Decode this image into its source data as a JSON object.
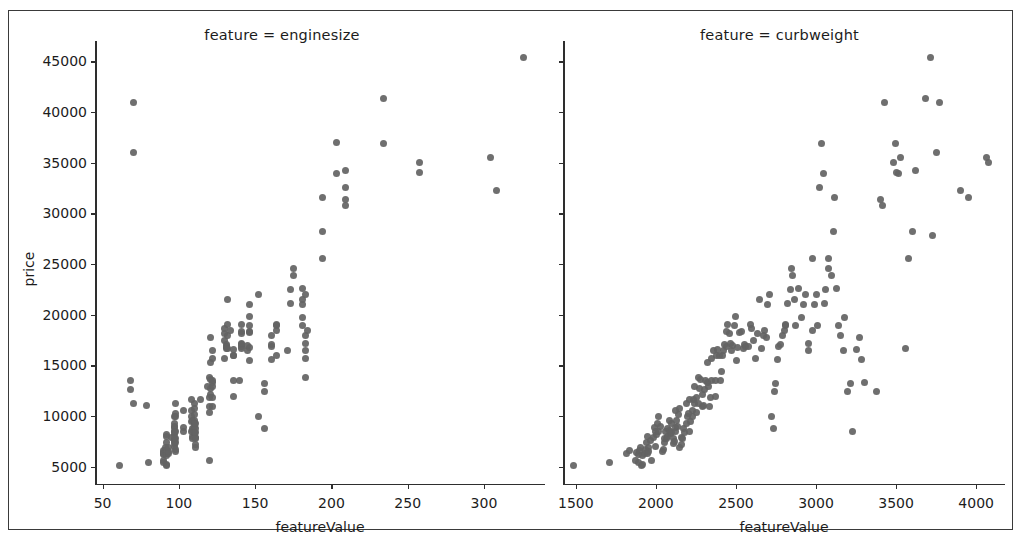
{
  "figure": {
    "ylabel": "price",
    "dot_color": "#636363",
    "axis_color": "#2e2e2e",
    "frame_color": "#3a3a3a"
  },
  "panels": [
    {
      "title": "feature = enginesize",
      "xlabel": "featureValue",
      "xticks": [
        50,
        100,
        150,
        200,
        250,
        300
      ],
      "xlim": [
        45,
        340
      ],
      "ylim": [
        3200,
        47000
      ],
      "yticks": [
        5000,
        10000,
        15000,
        20000,
        25000,
        30000,
        35000,
        40000,
        45000
      ]
    },
    {
      "title": "feature = curbweight",
      "xlabel": "featureValue",
      "xticks": [
        1500,
        2000,
        2500,
        3000,
        3500,
        4000
      ],
      "xlim": [
        1420,
        4180
      ],
      "ylim": [
        3200,
        47000
      ],
      "yticks": [
        5000,
        10000,
        15000,
        20000,
        25000,
        30000,
        35000,
        40000,
        45000
      ]
    }
  ],
  "chart_data": [
    {
      "type": "scatter",
      "title": "feature = enginesize",
      "xlabel": "featureValue",
      "ylabel": "price",
      "xlim": [
        45,
        340
      ],
      "ylim": [
        3200,
        47000
      ],
      "xticks": [
        50,
        100,
        150,
        200,
        250,
        300
      ],
      "yticks": [
        5000,
        10000,
        15000,
        20000,
        25000,
        30000,
        35000,
        40000,
        45000
      ],
      "grid": false,
      "legend": null,
      "marker_color": "#636363",
      "x": [
        61,
        80,
        90,
        90,
        90,
        90,
        90,
        90,
        91,
        91,
        92,
        92,
        92,
        92,
        92,
        92,
        92,
        92,
        93,
        93,
        93,
        95,
        97,
        97,
        97,
        97,
        97,
        97,
        97,
        97,
        97,
        97,
        97,
        97,
        98,
        98,
        98,
        98,
        98,
        98,
        98,
        98,
        103,
        103,
        103,
        108,
        108,
        108,
        108,
        108,
        109,
        109,
        109,
        109,
        109,
        110,
        110,
        110,
        110,
        110,
        110,
        110,
        110,
        111,
        111,
        111,
        111,
        111,
        111,
        111,
        114,
        119,
        120,
        120,
        120,
        121,
        121,
        121,
        121,
        121,
        122,
        122,
        122,
        122,
        122,
        122,
        122,
        130,
        130,
        130,
        130,
        131,
        131,
        131,
        131,
        132,
        132,
        132,
        132,
        134,
        136,
        136,
        136,
        136,
        136,
        140,
        141,
        141,
        141,
        141,
        141,
        141,
        141,
        145,
        145,
        146,
        146,
        146,
        146,
        146,
        146,
        146,
        152,
        152,
        156,
        156,
        156,
        161,
        161,
        161,
        161,
        164,
        164,
        164,
        164,
        171,
        173,
        173,
        175,
        175,
        181,
        181,
        181,
        181,
        181,
        183,
        183,
        183,
        183,
        183,
        183,
        184,
        194,
        194,
        194,
        203,
        203,
        209,
        209,
        209,
        209,
        234,
        234,
        258,
        258,
        304,
        308,
        326,
        70,
        70,
        70,
        68,
        68,
        79,
        120,
        120
      ],
      "y": [
        5151,
        5399,
        6295,
        6575,
        6377,
        6229,
        5572,
        5389,
        6649,
        6855,
        5118,
        5195,
        6295,
        6095,
        6695,
        7395,
        7995,
        8195,
        6338,
        6488,
        6918,
        7898,
        7609,
        8921,
        8449,
        6989,
        8189,
        9279,
        9959,
        8499,
        8949,
        7299,
        7799,
        7499,
        6479,
        6695,
        7395,
        7795,
        8495,
        10245,
        11245,
        9995,
        8845,
        8495,
        10595,
        8495,
        9495,
        9995,
        10595,
        11595,
        7775,
        7975,
        8778,
        8558,
        9538,
        8238,
        8358,
        9298,
        9538,
        8948,
        10198,
        10698,
        11248,
        6938,
        7198,
        7898,
        7788,
        8778,
        8358,
        9258,
        11595,
        12945,
        10345,
        11845,
        13845,
        12764,
        13645,
        12170,
        15250,
        17710,
        13295,
        12945,
        10945,
        11845,
        13495,
        15645,
        16515,
        18150,
        18620,
        17450,
        15645,
        16695,
        17075,
        16900,
        16845,
        19045,
        21485,
        16630,
        17950,
        18399,
        11900,
        13499,
        15998,
        16558,
        15998,
        13499,
        16695,
        17075,
        16900,
        18345,
        19045,
        18150,
        17199,
        16430,
        17000,
        18920,
        19845,
        15510,
        16770,
        18280,
        18344,
        20970,
        22018,
        9988,
        8778,
        12440,
        13200,
        15580,
        16900,
        17075,
        17950,
        18399,
        18920,
        19045,
        15985,
        16515,
        21105,
        22470,
        24565,
        23875,
        21485,
        18950,
        22625,
        19699,
        20970,
        22018,
        13845,
        15645,
        16515,
        17199,
        17950,
        18399,
        25552,
        28176,
        31600,
        37028,
        33900,
        32528,
        34184,
        31400,
        30760,
        36880,
        41315,
        34028,
        35056,
        35550,
        32250,
        45400,
        40960,
        35999,
        11199,
        13499,
        12629,
        11048,
        10898,
        5572,
        9095,
        9980
      ],
      "notes": "Price (USD) vs. engine size; strong positive correlation, ~200 points"
    },
    {
      "type": "scatter",
      "title": "feature = curbweight",
      "xlabel": "featureValue",
      "ylabel": "price",
      "xlim": [
        1420,
        4180
      ],
      "ylim": [
        3200,
        47000
      ],
      "xticks": [
        1500,
        2000,
        2500,
        3000,
        3500,
        4000
      ],
      "yticks": [
        5000,
        10000,
        15000,
        20000,
        25000,
        30000,
        35000,
        40000,
        45000
      ],
      "grid": false,
      "legend": null,
      "marker_color": "#636363",
      "x": [
        1488,
        1713,
        1819,
        1837,
        1874,
        1876,
        1889,
        1890,
        1900,
        1905,
        1909,
        1918,
        1918,
        1927,
        1938,
        1944,
        1945,
        1950,
        1951,
        1956,
        1967,
        1971,
        1985,
        1989,
        1995,
        1996,
        2004,
        2010,
        2017,
        2019,
        2028,
        2040,
        2050,
        2052,
        2055,
        2062,
        2065,
        2070,
        2075,
        2082,
        2085,
        2090,
        2095,
        2100,
        2108,
        2110,
        2116,
        2120,
        2122,
        2125,
        2128,
        2135,
        2140,
        2145,
        2150,
        2157,
        2160,
        2169,
        2172,
        2180,
        2190,
        2191,
        2200,
        2204,
        2208,
        2212,
        2219,
        2227,
        2230,
        2233,
        2240,
        2244,
        2251,
        2254,
        2264,
        2265,
        2275,
        2280,
        2289,
        2293,
        2300,
        2304,
        2310,
        2320,
        2324,
        2328,
        2335,
        2340,
        2349,
        2350,
        2360,
        2370,
        2372,
        2380,
        2385,
        2395,
        2403,
        2410,
        2414,
        2425,
        2430,
        2440,
        2443,
        2450,
        2458,
        2465,
        2472,
        2480,
        2489,
        2500,
        2505,
        2510,
        2520,
        2535,
        2548,
        2551,
        2560,
        2579,
        2590,
        2600,
        2612,
        2624,
        2635,
        2650,
        2661,
        2670,
        2679,
        2690,
        2700,
        2710,
        2720,
        2734,
        2740,
        2750,
        2760,
        2765,
        2778,
        2790,
        2800,
        2808,
        2811,
        2820,
        2840,
        2844,
        2850,
        2865,
        2870,
        2890,
        2910,
        2920,
        2935,
        2952,
        2954,
        2976,
        2980,
        2990,
        3000,
        3012,
        3020,
        3034,
        3045,
        3050,
        3062,
        3075,
        3080,
        3095,
        3110,
        3115,
        3130,
        3139,
        3151,
        3170,
        3180,
        3197,
        3217,
        3230,
        3250,
        3270,
        3285,
        3300,
        3380,
        3400,
        3415,
        3430,
        3485,
        3495,
        3505,
        3515,
        3530,
        3560,
        3580,
        3600,
        3620,
        3685,
        3715,
        3730,
        3750,
        3770,
        3900,
        3950,
        4066,
        4080
      ],
      "y": [
        5151,
        5399,
        6295,
        6575,
        5572,
        6377,
        6229,
        5389,
        6649,
        6855,
        5118,
        6095,
        5195,
        6295,
        6695,
        7395,
        7995,
        6338,
        6488,
        6918,
        7609,
        5572,
        7898,
        8921,
        6989,
        8449,
        8189,
        9279,
        8499,
        9959,
        8948,
        6479,
        6695,
        7395,
        7795,
        8495,
        7775,
        7975,
        8778,
        8558,
        9538,
        8238,
        8358,
        9298,
        7299,
        7799,
        7499,
        8845,
        8495,
        10595,
        9538,
        8948,
        10198,
        10698,
        6938,
        7198,
        7898,
        7788,
        8778,
        8358,
        9258,
        11245,
        9995,
        10245,
        11595,
        8495,
        9495,
        9995,
        10595,
        11595,
        11248,
        12945,
        10345,
        11845,
        13845,
        11199,
        12764,
        13645,
        12170,
        10898,
        11048,
        12629,
        13499,
        15250,
        13295,
        12945,
        10945,
        11845,
        13495,
        15645,
        16515,
        11900,
        13499,
        15998,
        16558,
        15998,
        13499,
        14399,
        15985,
        16515,
        17075,
        16900,
        18345,
        19045,
        18150,
        17199,
        16430,
        17000,
        18920,
        19845,
        15510,
        16770,
        18280,
        18344,
        16695,
        17075,
        16900,
        16845,
        19045,
        18620,
        17450,
        15645,
        18150,
        21485,
        16630,
        17950,
        18399,
        17710,
        20970,
        22018,
        9988,
        8778,
        12440,
        13200,
        15580,
        16900,
        17075,
        17950,
        18399,
        18920,
        19045,
        21105,
        22470,
        24565,
        23875,
        21485,
        18950,
        22625,
        19699,
        20970,
        22018,
        16515,
        17199,
        18399,
        25552,
        20970,
        22018,
        18950,
        32528,
        36880,
        33900,
        21105,
        22470,
        24565,
        25552,
        23875,
        28176,
        31600,
        22625,
        18950,
        17950,
        16515,
        19699,
        12440,
        13200,
        8449,
        16558,
        17710,
        15580,
        13295,
        12440,
        31400,
        30760,
        40960,
        35056,
        36880,
        34028,
        33900,
        35550,
        16695,
        25552,
        28176,
        34184,
        41315,
        45400,
        27800,
        35999,
        40960,
        32250,
        31600,
        35550,
        35056,
        31400
      ],
      "notes": "Price (USD) vs. curb weight (lbs); strong positive correlation, ~200 points"
    }
  ]
}
